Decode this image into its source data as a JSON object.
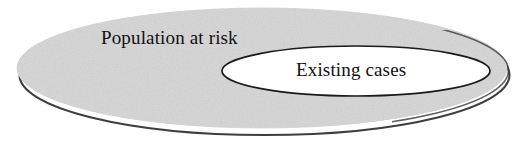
{
  "diagram": {
    "type": "euler-diagram",
    "background_color": "#ffffff",
    "outer_set": {
      "label": "Population at risk",
      "fill_color": "#d6d6d6",
      "shape": "ellipse",
      "has_drop_shadow": true,
      "shadow_color": "#2b2b2b"
    },
    "inner_set": {
      "label": "Existing cases",
      "fill_color": "#ffffff",
      "shape": "ellipse",
      "outline_color": "#1a1a1a",
      "nested_inside": "Population at risk"
    },
    "text_color": "#111111"
  }
}
